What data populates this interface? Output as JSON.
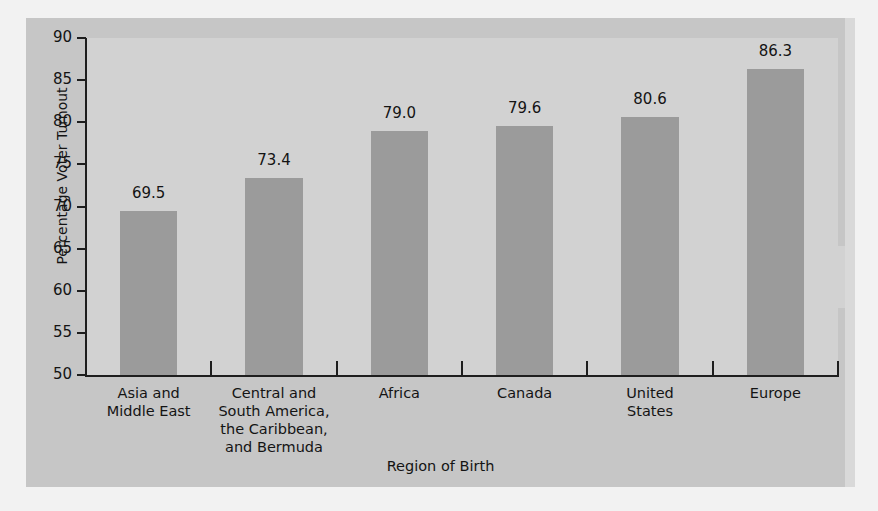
{
  "chart_data": {
    "type": "bar",
    "title": "",
    "xlabel": "Region of Birth",
    "ylabel": "Percentage Voter Turnout",
    "categories": [
      "Asia and\nMiddle East",
      "Central and\nSouth America,\nthe Caribbean,\nand Bermuda",
      "Africa",
      "Canada",
      "United\nStates",
      "Europe"
    ],
    "values": [
      69.5,
      73.4,
      79.0,
      79.6,
      80.6,
      86.3
    ],
    "value_labels": [
      "69.5",
      "73.4",
      "79.0",
      "79.6",
      "80.6",
      "86.3"
    ],
    "ylim": [
      50,
      90
    ],
    "yticks": [
      90,
      85,
      80,
      75,
      70,
      65,
      60,
      55,
      50
    ],
    "ytick_labels": [
      "90",
      "85",
      "80",
      "75",
      "70",
      "65",
      "60",
      "55",
      "50"
    ],
    "grid": false,
    "legend": null,
    "bar_color": "#9b9b9b",
    "plot_background": "#d2d2d2",
    "panel_background": "#c6c6c6",
    "axis_color": "#1e1e1e",
    "text_color": "#141414"
  }
}
